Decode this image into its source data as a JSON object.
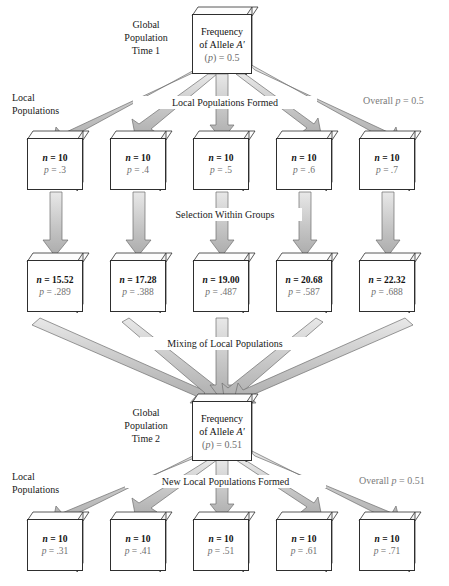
{
  "figure": {
    "title_labels": {
      "global_t1": "Global\nPopulation\nTime 1",
      "global_t1_l1": "Global",
      "global_t1_l2": "Population",
      "global_t1_l3": "Time 1",
      "global_t2_l1": "Global",
      "global_t2_l2": "Population",
      "global_t2_l3": "Time 2",
      "local_pops_l1": "Local",
      "local_pops_l2": "Populations",
      "local_pops2_l1": "Local",
      "local_pops2_l2": "Populations"
    },
    "process_labels": {
      "formation": "Local Populations Formed",
      "selection": "Selection Within Groups",
      "mixing": "Mixing of Local Populations",
      "reformation": "New Local Populations Formed"
    },
    "overall": {
      "top": "Overall p = 0.5",
      "bottom": "Overall p = 0.51"
    },
    "global_t1": {
      "line1": "Frequency",
      "line2": "of Allele A′",
      "line3": "(p) = 0.5"
    },
    "global_t2": {
      "line1": "Frequency",
      "line2": "of Allele A′",
      "line3": "(p) = 0.51"
    },
    "rows": [
      {
        "id": "row-initial-local-populations",
        "boxes": [
          {
            "n": "n = 10",
            "p": "p = .3"
          },
          {
            "n": "n = 10",
            "p": "p = .4"
          },
          {
            "n": "n = 10",
            "p": "p = .5"
          },
          {
            "n": "n = 10",
            "p": "p = .6"
          },
          {
            "n": "n = 10",
            "p": "p = .7"
          }
        ]
      },
      {
        "id": "row-after-selection",
        "boxes": [
          {
            "n": "n = 15.52",
            "p": "p = .289"
          },
          {
            "n": "n = 17.28",
            "p": "p = .388"
          },
          {
            "n": "n = 19.00",
            "p": "p = .487"
          },
          {
            "n": "n = 20.68",
            "p": "p = .587"
          },
          {
            "n": "n = 22.32",
            "p": "p = .688"
          }
        ]
      },
      {
        "id": "row-new-local-populations",
        "boxes": [
          {
            "n": "n = 10",
            "p": "p = .31"
          },
          {
            "n": "n = 10",
            "p": "p = .41"
          },
          {
            "n": "n = 10",
            "p": "p = .51"
          },
          {
            "n": "n = 10",
            "p": "p = .61"
          },
          {
            "n": "n = 10",
            "p": "p = .71"
          }
        ]
      }
    ],
    "colors": {
      "arrow_fill": "#c9c9c9",
      "arrow_stroke": "#6a6a6a",
      "box_stroke": "#2e2e2e",
      "box_fill": "#ffffff",
      "text": "#1a1a1a",
      "muted_text": "#6f6f6f"
    }
  }
}
